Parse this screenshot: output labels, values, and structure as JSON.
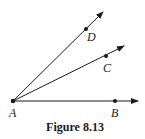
{
  "figure": {
    "caption": "Figure 8.13",
    "vertex": {
      "label": "A",
      "x": 13,
      "y": 101
    },
    "rays": [
      {
        "name": "ray-AB",
        "point_label": "B",
        "point": [
          115,
          101
        ],
        "tip": [
          138,
          101
        ]
      },
      {
        "name": "ray-AC",
        "point_label": "C",
        "point": [
          106,
          56
        ],
        "tip": [
          124,
          46
        ]
      },
      {
        "name": "ray-AD",
        "point_label": "D",
        "point": [
          86,
          29
        ],
        "tip": [
          103,
          12
        ]
      }
    ],
    "colors": {
      "stroke": "#1a1a1a",
      "background": "#ffffff"
    }
  }
}
